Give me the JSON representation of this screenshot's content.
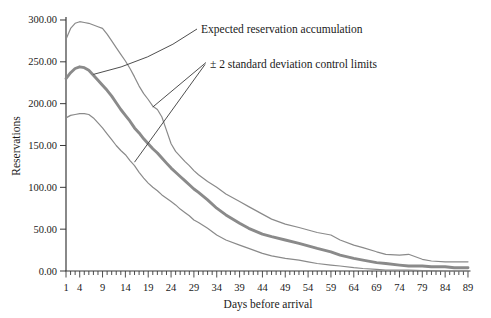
{
  "figure": {
    "background": "#ffffff"
  },
  "chart_data": {
    "type": "line",
    "title": "",
    "xlabel": "Days before arrival",
    "ylabel": "Reservations",
    "grid": false,
    "legend": "none (labeled by pointer annotations)",
    "x_axis": {
      "min": 1,
      "max": 89,
      "minor_tick_every_days": 1,
      "tick_labels": [
        1,
        4,
        9,
        14,
        19,
        24,
        29,
        34,
        39,
        44,
        49,
        54,
        59,
        64,
        69,
        74,
        79,
        84,
        89
      ]
    },
    "y_axis": {
      "min": 0,
      "max": 300,
      "tick_step": 50,
      "ticks": [
        {
          "value": 0,
          "label": "0.00"
        },
        {
          "value": 50,
          "label": "50.00"
        },
        {
          "value": 100,
          "label": "100.00"
        },
        {
          "value": 150,
          "label": "150.00"
        },
        {
          "value": 200,
          "label": "200.00"
        },
        {
          "value": 250,
          "label": "250.00"
        },
        {
          "value": 300,
          "label": "300.00"
        }
      ]
    },
    "x": [
      1,
      2,
      3,
      4,
      5,
      6,
      7,
      8,
      9,
      10,
      11,
      12,
      13,
      14,
      15,
      16,
      17,
      18,
      19,
      20,
      21,
      22,
      23,
      24,
      25,
      26,
      27,
      28,
      29,
      30,
      32,
      34,
      36,
      39,
      41,
      44,
      46,
      49,
      52,
      54,
      56,
      59,
      61,
      64,
      66,
      69,
      71,
      74,
      76,
      79,
      81,
      84,
      86,
      89
    ],
    "series": [
      {
        "name": "Expected reservation accumulation",
        "role": "expected",
        "style": "thick",
        "values": [
          230,
          237,
          242,
          244,
          243,
          240,
          234,
          228,
          222,
          216,
          209,
          201,
          193,
          186,
          179,
          171,
          165,
          158,
          152,
          146,
          141,
          135,
          129,
          123,
          118,
          113,
          108,
          103,
          98,
          94,
          85,
          75,
          67,
          57,
          51,
          44,
          41,
          37,
          33,
          30,
          27,
          23,
          19,
          15,
          13,
          10,
          9,
          7,
          6,
          6,
          5,
          5,
          4,
          4
        ]
      },
      {
        "name": "+2 standard deviation control limit",
        "role": "upper_limit",
        "style": "thin",
        "values": [
          277,
          290,
          296,
          298,
          297,
          296,
          294,
          292,
          290,
          283,
          275,
          267,
          259,
          251,
          242,
          232,
          221,
          212,
          205,
          197,
          193,
          184,
          168,
          152,
          143,
          137,
          131,
          126,
          120,
          115,
          107,
          100,
          92,
          83,
          77,
          68,
          62,
          56,
          52,
          49,
          46,
          43,
          37,
          31,
          28,
          23,
          20,
          19,
          20,
          14,
          12,
          11,
          11,
          11
        ]
      },
      {
        "name": "-2 standard deviation control limit",
        "role": "lower_limit",
        "style": "thin",
        "values": [
          183,
          186,
          187,
          188,
          188,
          187,
          183,
          177,
          171,
          164,
          157,
          150,
          144,
          139,
          132,
          126,
          118,
          111,
          105,
          100,
          96,
          91,
          87,
          83,
          79,
          74,
          70,
          66,
          61,
          58,
          51,
          43,
          37,
          31,
          27,
          21,
          18,
          15,
          13,
          11,
          9,
          7,
          6,
          4,
          3,
          2,
          1,
          1,
          1,
          0.5,
          0.5,
          0,
          0,
          0
        ]
      }
    ],
    "annotations": [
      {
        "text": "Expected reservation accumulation",
        "points_to": [
          {
            "series": "expected",
            "day": 7,
            "value": 235
          }
        ]
      },
      {
        "text": "± 2 standard deviation control limits",
        "points_to": [
          {
            "series": "upper_limit",
            "day": 20,
            "value": 196
          },
          {
            "series": "lower_limit",
            "day": 16,
            "value": 130
          }
        ]
      }
    ],
    "colors": {
      "curve": "#8a8a8a",
      "axis": "#3a3a3a",
      "text": "#1a1a1a"
    },
    "layout": {
      "x0": 66,
      "px_per_day": 4.568,
      "y_base": 271,
      "px_per_unit": 0.8367,
      "y_top": 17,
      "x_end": 470.5
    }
  }
}
